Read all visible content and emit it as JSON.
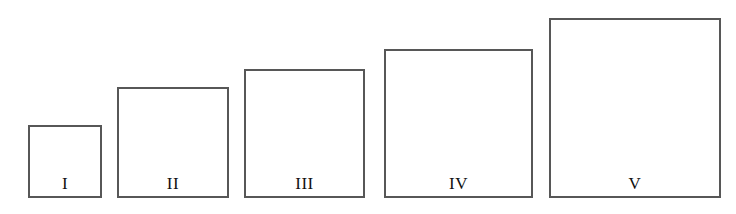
{
  "figure": {
    "canvas_width": 736,
    "canvas_height": 214,
    "background_color": "#ffffff",
    "box_border_color": "#575757",
    "box_fill_color": "#ffffff",
    "box_border_width_px": 2,
    "label_color": "#111111",
    "baseline_y": 198
  },
  "chart_data": {
    "type": "bar",
    "title": "",
    "subtitle": "",
    "xlabel": "",
    "ylabel": "",
    "grid": false,
    "legend": null,
    "orientation": "vertical",
    "note": "Five outlined rectangles of increasing size, bottom-aligned on a common baseline, each labelled with a Roman numeral.",
    "categories": [
      "I",
      "II",
      "III",
      "IV",
      "V"
    ],
    "values": [
      73,
      111,
      129,
      149,
      180
    ],
    "widths": [
      74,
      112,
      121,
      149,
      172
    ],
    "ylim": [
      0,
      196
    ],
    "xlim": [
      0,
      736
    ]
  },
  "boxes": [
    {
      "label": "I",
      "x": 28,
      "y": 125,
      "width": 74,
      "height": 73
    },
    {
      "label": "II",
      "x": 117,
      "y": 87,
      "width": 112,
      "height": 111
    },
    {
      "label": "III",
      "x": 244,
      "y": 69,
      "width": 121,
      "height": 129
    },
    {
      "label": "IV",
      "x": 384,
      "y": 49,
      "width": 149,
      "height": 149
    },
    {
      "label": "V",
      "x": 549,
      "y": 18,
      "width": 172,
      "height": 180
    }
  ]
}
